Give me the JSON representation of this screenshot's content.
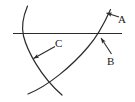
{
  "figure": {
    "background_color": "#ffffff",
    "stroke_color": "#2b2b2b",
    "label_color": "#1a1a1a",
    "labels": [
      {
        "id": "A",
        "text": "A",
        "points_to": "upper end of the large arc above the line"
      },
      {
        "id": "B",
        "text": "B",
        "points_to": "intersection of the large arc with the horizontal line"
      },
      {
        "id": "C",
        "text": "C",
        "points_to": "the left arc below the horizontal line"
      }
    ],
    "elements": {
      "horizontal_line": "horizontal straight line",
      "left_arc": "small arc curving from top down to bottom right",
      "large_arc": "large arc sweeping from bottom left up to top right",
      "arrow_a": "leader arrow to A",
      "arrow_b": "leader arrow to B",
      "arrow_c": "leader arrow to C"
    }
  }
}
